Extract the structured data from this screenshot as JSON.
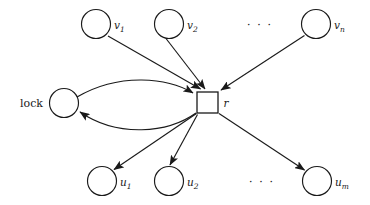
{
  "diagram": {
    "colors": {
      "stroke": "#1a1a1a",
      "fill": "#ffffff",
      "background": "#ffffff"
    },
    "nodes": {
      "lock": {
        "label": "lock",
        "shape": "circle",
        "cx": 64,
        "cy": 103,
        "r": 14.5,
        "label_x": 20,
        "label_y": 107
      },
      "resource": {
        "label": "r",
        "shape": "square",
        "x": 197,
        "y": 92,
        "size": 21,
        "label_x": 223.5,
        "label_y": 107
      },
      "waiting": [
        {
          "id": "v1",
          "base": "v",
          "sub": "1",
          "cx": 96,
          "cy": 24,
          "r": 14.5,
          "label_x": 114,
          "label_y": 29
        },
        {
          "id": "v2",
          "base": "v",
          "sub": "2",
          "cx": 169,
          "cy": 24,
          "r": 14.5,
          "label_x": 187,
          "label_y": 29
        },
        {
          "id": "vn",
          "base": "v",
          "sub": "n",
          "cx": 316,
          "cy": 24,
          "r": 14.5,
          "label_x": 334,
          "label_y": 29
        }
      ],
      "holding": [
        {
          "id": "u1",
          "base": "u",
          "sub": "1",
          "cx": 102,
          "cy": 181,
          "r": 14.5,
          "label_x": 120,
          "label_y": 186
        },
        {
          "id": "u2",
          "base": "u",
          "sub": "2",
          "cx": 169,
          "cy": 181,
          "r": 14.5,
          "label_x": 187,
          "label_y": 186
        },
        {
          "id": "um",
          "base": "u",
          "sub": "m",
          "cx": 317,
          "cy": 181,
          "r": 14.5,
          "label_x": 335,
          "label_y": 186
        }
      ]
    },
    "ellipses": [
      {
        "id": "top-ellipsis",
        "text": "· · ·",
        "x": 247,
        "y": 29
      },
      {
        "id": "bottom-ellipsis",
        "text": "· · ·",
        "x": 249,
        "y": 186
      }
    ],
    "edges": {
      "incoming": [
        {
          "id": "v1-to-r",
          "from": "v1",
          "to": "resource",
          "x1": 108,
          "y1": 36,
          "x2": 201,
          "y2": 90
        },
        {
          "id": "v2-to-r",
          "from": "v2",
          "to": "resource",
          "x1": 170,
          "y1": 39,
          "x2": 205,
          "y2": 90
        },
        {
          "id": "vn-to-r",
          "from": "vn",
          "to": "resource",
          "x1": 304,
          "y1": 36,
          "x2": 220,
          "y2": 90
        }
      ],
      "outgoing": [
        {
          "id": "r-to-u1",
          "from": "resource",
          "to": "u1",
          "x1": 196,
          "y1": 114,
          "x2": 113,
          "y2": 169
        },
        {
          "id": "r-to-u2",
          "from": "resource",
          "to": "u2",
          "x1": 197,
          "y1": 115,
          "x2": 170,
          "y2": 166
        },
        {
          "id": "r-to-um",
          "from": "resource",
          "to": "um",
          "x1": 219,
          "y1": 114,
          "x2": 305,
          "y2": 170
        }
      ],
      "curved": [
        {
          "id": "lock-to-r",
          "from": "lock",
          "to": "resource",
          "direction": "right",
          "d": "M 77 97 C 120 72, 168 78, 195 94"
        },
        {
          "id": "r-to-lock",
          "from": "resource",
          "to": "lock",
          "direction": "left",
          "d": "M 196 113 C 168 133, 118 138, 79 111"
        }
      ]
    }
  }
}
